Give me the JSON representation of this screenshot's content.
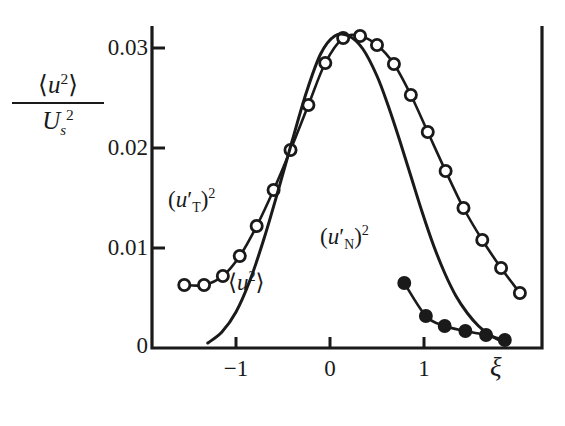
{
  "chart_data": {
    "type": "line",
    "title": "",
    "xlabel": "ξ",
    "ylabel_numerator": "⟨u²⟩",
    "ylabel_denominator": "U²s",
    "xlim": [
      -1.62,
      2.25
    ],
    "ylim": [
      0,
      0.0348
    ],
    "xticks": [
      -1,
      0,
      1
    ],
    "xtick_labels": [
      "−1",
      "0",
      "1"
    ],
    "yticks": [
      0,
      0.01,
      0.02,
      0.03
    ],
    "ytick_labels": [
      "0",
      "0.01",
      "0.02",
      "0.03"
    ],
    "grid": false,
    "legend": "inline-annotations",
    "series": [
      {
        "name": "(u'T)²",
        "marker": "open-circle",
        "label_text_parts": {
          "base": "(u",
          "prime": "′",
          "sub": "T",
          "close": ")",
          "exp": "2"
        },
        "label_x": -1.18,
        "label_y": 0.0148,
        "x": [
          -1.55,
          -1.34,
          -1.14,
          -0.96,
          -0.78,
          -0.6,
          -0.42,
          -0.23,
          -0.05,
          0.14,
          0.32,
          0.5,
          0.68,
          0.86,
          1.04,
          1.23,
          1.42,
          1.62,
          1.82,
          2.02
        ],
        "y": [
          0.0063,
          0.0063,
          0.0072,
          0.0092,
          0.0122,
          0.0158,
          0.0198,
          0.0243,
          0.0285,
          0.031,
          0.0312,
          0.0303,
          0.0284,
          0.0253,
          0.0216,
          0.0177,
          0.014,
          0.0108,
          0.008,
          0.0055
        ]
      },
      {
        "name": "(u'N)²",
        "marker": "filled-circle",
        "label_text_parts": {
          "base": "(u",
          "prime": "′",
          "sub": "N",
          "close": ")",
          "exp": "2"
        },
        "label_x": 0.6,
        "label_y": 0.0102,
        "x": [
          0.79,
          1.02,
          1.22,
          1.44,
          1.66,
          1.86
        ],
        "y": [
          0.0065,
          0.0032,
          0.0022,
          0.0017,
          0.0013,
          0.0008
        ]
      },
      {
        "name": "⟨u²⟩",
        "marker": "none",
        "label_text_parts": {
          "base": "⟨u",
          "prime": "",
          "sub": "",
          "close": "⟩",
          "exp": "2"
        },
        "label_x": -0.48,
        "label_y": 0.0058,
        "x": [
          -1.3,
          -1.15,
          -1.0,
          -0.85,
          -0.7,
          -0.55,
          -0.4,
          -0.25,
          -0.1,
          0.05,
          0.2,
          0.35,
          0.5,
          0.62,
          0.74,
          0.86,
          0.98,
          1.1,
          1.22,
          1.34,
          1.46,
          1.58,
          1.7,
          1.82
        ],
        "y": [
          0.0005,
          0.0016,
          0.0036,
          0.0068,
          0.011,
          0.0158,
          0.0208,
          0.0256,
          0.0294,
          0.0312,
          0.0312,
          0.0299,
          0.0272,
          0.0242,
          0.0208,
          0.0172,
          0.0136,
          0.0103,
          0.0075,
          0.0052,
          0.0035,
          0.0022,
          0.0013,
          0.0007
        ]
      }
    ]
  },
  "axis_labels": {
    "y_numerator": "⟨u²⟩",
    "y_denominator_base": "U",
    "y_denominator_sub": "s",
    "y_denominator_exp": "2",
    "x_symbol": "ξ"
  }
}
